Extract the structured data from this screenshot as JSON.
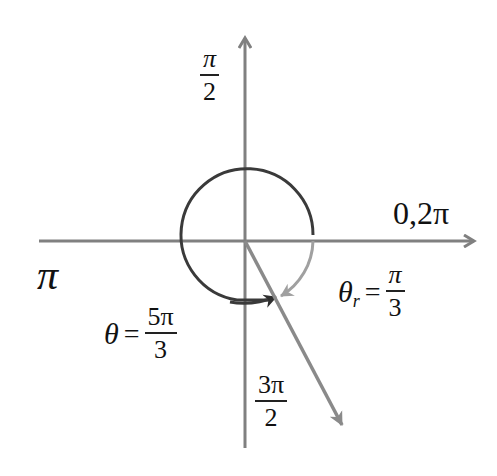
{
  "diagram": {
    "type": "unit-circle-angle",
    "colors": {
      "axis": "#808080",
      "circle": "#3a3a3a",
      "reference_arc": "#999999",
      "terminal_ray": "#8a8a8a",
      "text": "#111111"
    },
    "labels": {
      "top": {
        "num": "π",
        "den": "2"
      },
      "right": "0,2π",
      "left": "π",
      "bottom": {
        "num": "3π",
        "den": "2"
      },
      "theta": {
        "symbol": "θ",
        "eq": "=",
        "num": "5π",
        "den": "3"
      },
      "theta_r": {
        "symbol": "θ",
        "sub": "r",
        "eq": "=",
        "num": "π",
        "den": "3"
      }
    }
  }
}
